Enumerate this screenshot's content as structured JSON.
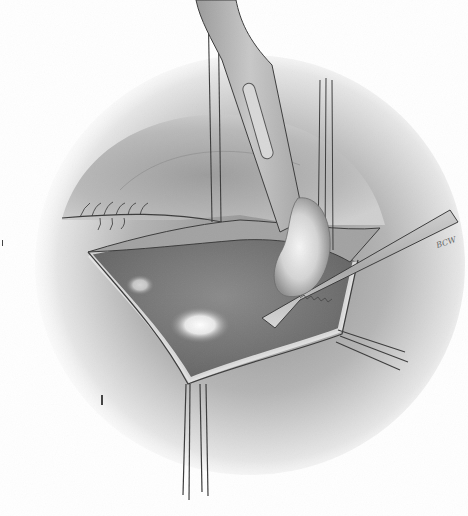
{
  "illustration": {
    "subject": "surgical illustration - retracted incision with forceps and scalpel",
    "style": "grayscale pencil drawing",
    "signature": "BCW",
    "colors": {
      "paper": "#ffffff",
      "shading_dark": "#5a5a5a",
      "shading_mid": "#9a9a9a",
      "shading_light": "#d8d8d8",
      "cavity": "#7c7c7c",
      "highlight": "#f2f2f2",
      "instrument": "#bdbdbd",
      "outline": "#3a3a3a"
    }
  }
}
